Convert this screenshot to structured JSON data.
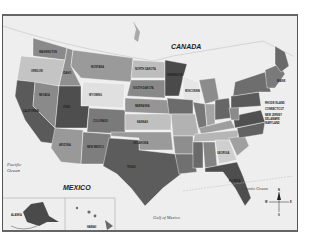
{
  "map": {
    "title": "United States Political Map",
    "country_labels": {
      "canada": "CANADA",
      "mexico": "MEXICO"
    },
    "water_labels": {
      "pacific_1": "Pacific",
      "pacific_2": "Ocean",
      "atlantic": "Atlantic Ocean",
      "gulf": "Gulf of Mexico"
    },
    "inset_labels": {
      "alaska": "ALASKA",
      "hawaii": "HAWAII"
    },
    "state_labels": {
      "washington": "WASHINGTON",
      "oregon": "OREGON",
      "idaho": "IDAHO",
      "montana": "MONTANA",
      "wyoming": "WYOMING",
      "north_dakota": "NORTH DAKOTA",
      "south_dakota": "SOUTH DAKOTA",
      "nebraska": "NEBRASKA",
      "minnesota": "MINNESOTA",
      "wisconsin": "WISCONSIN",
      "utah": "UTAH",
      "colorado": "COLORADO",
      "kansas": "KANSAS",
      "arizona": "ARIZONA",
      "new_mexico": "NEW MEXICO",
      "texas": "TEXAS",
      "oklahoma": "OKLAHOMA",
      "maine": "MAINE",
      "rhode_island": "RHODE ISLAND",
      "connecticut": "CONNECTICUT",
      "new_jersey": "NEW JERSEY",
      "delaware": "DELAWARE",
      "maryland": "MARYLAND",
      "georgia": "GEORGIA",
      "florida": "FLORIDA",
      "california": "CALIFORNIA",
      "nevada": "NEVADA"
    },
    "compass": {
      "n": "N",
      "s": "S",
      "e": "E",
      "w": "W"
    },
    "colors": {
      "frame": "#555555",
      "water": "#eeeeee",
      "dark": "#4a4a4a",
      "mid": "#7a7a7a",
      "light": "#a8a8a8",
      "pale": "#d4d4d4"
    }
  }
}
